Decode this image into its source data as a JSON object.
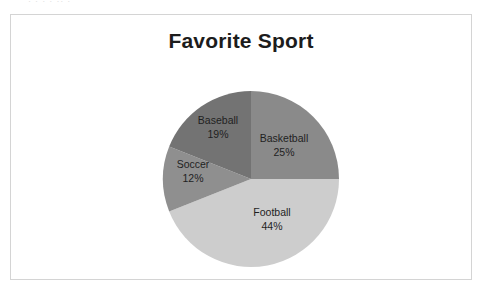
{
  "page": {
    "background_color": "#ffffff",
    "frame_border_color": "#d4d4d4",
    "scan_artifact_text": "·  ·   · ·   ··   ·"
  },
  "chart_data": {
    "type": "pie",
    "title": "Favorite Sport",
    "xlabel": "",
    "ylabel": "",
    "legend": "none",
    "labels_inside_slices": true,
    "start_angle_deg": 0,
    "direction": "clockwise",
    "categories": [
      "Basketball",
      "Football",
      "Soccer",
      "Baseball"
    ],
    "values": [
      25,
      44,
      12,
      19
    ],
    "value_unit": "%",
    "total": 100,
    "slices": [
      {
        "name": "Basketball",
        "percent": 25,
        "percent_label": "25%",
        "color": "#8a8a8a",
        "start_angle_deg": 0,
        "end_angle_deg": 90
      },
      {
        "name": "Football",
        "percent": 44,
        "percent_label": "44%",
        "color": "#cdcdcd",
        "start_angle_deg": 90,
        "end_angle_deg": 248.4
      },
      {
        "name": "Soccer",
        "percent": 12,
        "percent_label": "12%",
        "color": "#8f8f8f",
        "start_angle_deg": 248.4,
        "end_angle_deg": 291.6
      },
      {
        "name": "Baseball",
        "percent": 19,
        "percent_label": "19%",
        "color": "#737373",
        "start_angle_deg": 291.6,
        "end_angle_deg": 360
      }
    ]
  }
}
